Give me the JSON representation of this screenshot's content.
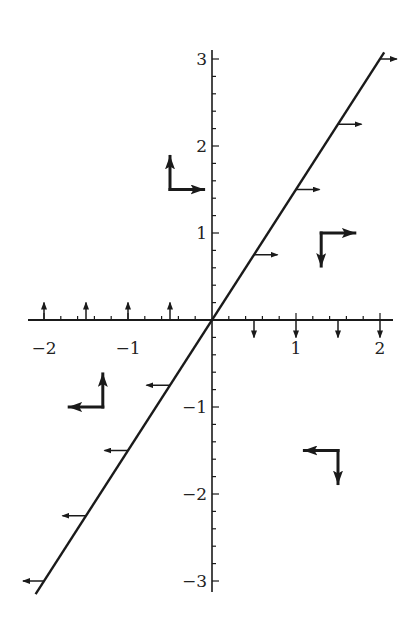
{
  "chart_data": {
    "type": "vector-field-diagram",
    "title": "",
    "xlabel": "",
    "ylabel": "",
    "xlim": [
      -2.2,
      2.2
    ],
    "ylim": [
      -3.1,
      3.1
    ],
    "grid": false,
    "x_ticks": [
      -2,
      -1,
      1,
      2
    ],
    "x_tick_labels": [
      "−2",
      "−1",
      "1",
      "2"
    ],
    "y_ticks": [
      -3,
      -2,
      -1,
      1,
      2,
      3
    ],
    "y_tick_labels": [
      "−3",
      "−2",
      "−1",
      "1",
      "2",
      "3"
    ],
    "minor_tick_step": 0.2,
    "line": {
      "equation": "y = 1.5x",
      "slope": 1.5,
      "x_range": [
        -2.1,
        2.05
      ]
    },
    "line_arrows": [
      {
        "x": 0.5,
        "y": 0.75,
        "dx": 0.28,
        "dy": 0
      },
      {
        "x": 1,
        "y": 1.5,
        "dx": 0.28,
        "dy": 0
      },
      {
        "x": 1.5,
        "y": 2.25,
        "dx": 0.28,
        "dy": 0
      },
      {
        "x": 2,
        "y": 3,
        "dx": 0.2,
        "dy": 0
      },
      {
        "x": -0.5,
        "y": -0.75,
        "dx": -0.28,
        "dy": 0
      },
      {
        "x": -1,
        "y": -1.5,
        "dx": -0.28,
        "dy": 0
      },
      {
        "x": -1.5,
        "y": -2.25,
        "dx": -0.28,
        "dy": 0
      },
      {
        "x": -2,
        "y": -3,
        "dx": -0.25,
        "dy": 0
      }
    ],
    "axis_arrows": [
      {
        "x": -2,
        "y": 0,
        "dx": 0,
        "dy": 0.2
      },
      {
        "x": -1.5,
        "y": 0,
        "dx": 0,
        "dy": 0.2
      },
      {
        "x": -1,
        "y": 0,
        "dx": 0,
        "dy": 0.2
      },
      {
        "x": -0.5,
        "y": 0,
        "dx": 0,
        "dy": 0.2
      },
      {
        "x": 0.5,
        "y": 0,
        "dx": 0,
        "dy": -0.2
      },
      {
        "x": 1,
        "y": 0,
        "dx": 0,
        "dy": -0.2
      },
      {
        "x": 1.5,
        "y": 0,
        "dx": 0,
        "dy": -0.2
      },
      {
        "x": 2,
        "y": 0,
        "dx": 0,
        "dy": -0.2
      }
    ],
    "basis_pairs": [
      {
        "x": -0.5,
        "y": 1.5,
        "v1": [
          0.4,
          0
        ],
        "v2": [
          0,
          0.38
        ]
      },
      {
        "x": 1.3,
        "y": 1,
        "v1": [
          0.4,
          0
        ],
        "v2": [
          0,
          -0.38
        ]
      },
      {
        "x": -1.3,
        "y": -1,
        "v1": [
          -0.4,
          0
        ],
        "v2": [
          0,
          0.38
        ]
      },
      {
        "x": 1.5,
        "y": -1.5,
        "v1": [
          -0.4,
          0
        ],
        "v2": [
          0,
          -0.38
        ]
      }
    ],
    "colors": {
      "ink": "#1a1a1a",
      "background": "#ffffff"
    }
  }
}
